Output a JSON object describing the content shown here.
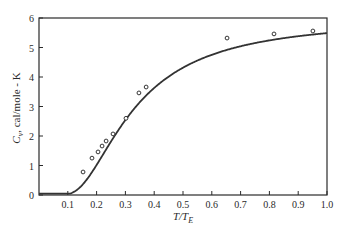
{
  "chart_data": {
    "type": "line",
    "title": "",
    "xlabel": "T/T_E",
    "xlabel_main": "T/T",
    "xlabel_sub": "E",
    "ylabel": "C_v, cal/mole-K",
    "ylabel_main": "C",
    "ylabel_sub": "v",
    "ylabel_rest": ", cal/mole - K",
    "xlim": [
      0,
      1.0
    ],
    "ylim": [
      0,
      6
    ],
    "xticks": [
      0.1,
      0.2,
      0.3,
      0.4,
      0.5,
      0.6,
      0.7,
      0.8,
      0.9,
      1.0
    ],
    "xtick_labels": [
      "0.1",
      "0.2",
      "0.3",
      "0.4",
      "0.5",
      "0.6",
      "0.7",
      "0.8",
      "0.9",
      "1.0"
    ],
    "yticks": [
      0,
      1,
      2,
      3,
      4,
      5,
      6
    ],
    "ytick_labels": [
      "0",
      "1",
      "2",
      "3",
      "4",
      "5",
      "6"
    ],
    "grid": false,
    "legend": null,
    "series": [
      {
        "name": "Einstein model curve",
        "kind": "line",
        "formula": "3R * (x^2 e^x / (e^x - 1)^2), x = T_E/T",
        "three_R": 5.96,
        "x": [
          0.0,
          0.05,
          0.1,
          0.15,
          0.2,
          0.25,
          0.3,
          0.35,
          0.4,
          0.5,
          0.6,
          0.7,
          0.8,
          0.9,
          1.0
        ],
        "values": [
          0.0,
          0.0,
          0.03,
          0.45,
          1.21,
          1.97,
          2.62,
          3.13,
          3.52,
          4.13,
          4.55,
          4.85,
          5.08,
          5.25,
          5.48
        ]
      },
      {
        "name": "Experimental data",
        "kind": "scatter",
        "marker": "open-circle",
        "x": [
          0.153,
          0.184,
          0.205,
          0.219,
          0.233,
          0.257,
          0.302,
          0.347,
          0.372,
          0.653,
          0.816,
          0.951
        ],
        "values": [
          0.78,
          1.25,
          1.46,
          1.66,
          1.83,
          2.07,
          2.6,
          3.46,
          3.66,
          5.32,
          5.46,
          5.56
        ]
      }
    ]
  },
  "colors": {
    "axis": "#2a2a2a",
    "curve": "#333333",
    "marker": "#333333",
    "background": "#ffffff"
  }
}
